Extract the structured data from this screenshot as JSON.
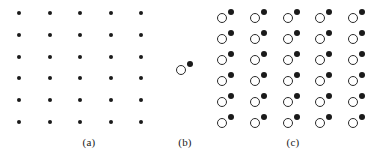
{
  "figure": {
    "width": 378,
    "height": 158,
    "background_color": "#ffffff"
  },
  "style": {
    "dot_color": "#1a1a1a",
    "circle_stroke_color": "#2a2a2a",
    "lattice_dot_diameter": 4,
    "basis_dot_diameter": 6,
    "basis_circle_diameter": 10,
    "circle_stroke_width": 1.1
  },
  "panels": [
    {
      "id": "a",
      "caption": "(a)",
      "caption_x": 89,
      "caption_y": 136,
      "role": "lattice",
      "grid": {
        "columns": 5,
        "rows": 6,
        "origin_x": 19,
        "origin_y": 13,
        "spacing_x": 30.5,
        "spacing_y": 21.8
      },
      "motif": [
        {
          "shape": "dot",
          "dx": 0,
          "dy": 0
        }
      ]
    },
    {
      "id": "b",
      "caption": "(b)",
      "caption_x": 185,
      "caption_y": 136,
      "role": "basis",
      "grid": {
        "columns": 1,
        "rows": 1,
        "origin_x": 181,
        "origin_y": 70,
        "spacing_x": 0,
        "spacing_y": 0
      },
      "motif": [
        {
          "shape": "circle",
          "dx": 0,
          "dy": 0
        },
        {
          "shape": "dot",
          "dx": 9,
          "dy": -6
        }
      ]
    },
    {
      "id": "c",
      "caption": "(c)",
      "caption_x": 293,
      "caption_y": 136,
      "role": "crystal",
      "grid": {
        "columns": 5,
        "rows": 6,
        "origin_x": 222,
        "origin_y": 18,
        "spacing_x": 32.8,
        "spacing_y": 20.9
      },
      "motif": [
        {
          "shape": "circle",
          "dx": 0,
          "dy": 0
        },
        {
          "shape": "dot",
          "dx": 9,
          "dy": -6
        }
      ]
    }
  ]
}
